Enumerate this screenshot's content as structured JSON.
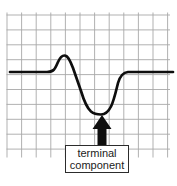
{
  "annotation": {
    "line1": "terminal",
    "line2": "component"
  },
  "figure": {
    "colors": {
      "background": "#ffffff",
      "grid": "#a8a8a8",
      "wave": "#0e0e0e",
      "arrow": "#0e0e0e",
      "box_border": "#2c2c2c",
      "box_fill": "#ffffff",
      "text": "#1b1b1b"
    },
    "grid": {
      "x_start": 7,
      "x_step": 14.6,
      "x_count": 12,
      "v_top": 12.5,
      "v_bottom": 157.5,
      "y_start": 15,
      "y_step": 14.9,
      "y_count": 10,
      "h_left": 6.5,
      "h_right": 170
    },
    "waveform": {
      "baseline_y": 72,
      "peak": {
        "x": 64.5,
        "y": 55.5
      },
      "trough": {
        "x": 101,
        "y": 114.5
      },
      "path": "M 10,72 L 47,72 C 54,72 55,69 58,62 C 60,57.5 62,55.5 64.5,55.5 C 67.5,55.5 69.5,59 73,68 L 81,91 C 84,101 87,108 91,111.5 C 94,114 98,114.5 101,114.5 C 105,114.5 108,112.5 111,106.5 C 114,100.5 116,91 118,83 C 120,76 123,72.5 128,72 L 173,72"
    },
    "arrow": {
      "direction": "up",
      "points": "102,115 92.5,129 97.5,129 97.5,145.5 106.5,145.5 106.5,129 111.5,129"
    }
  }
}
